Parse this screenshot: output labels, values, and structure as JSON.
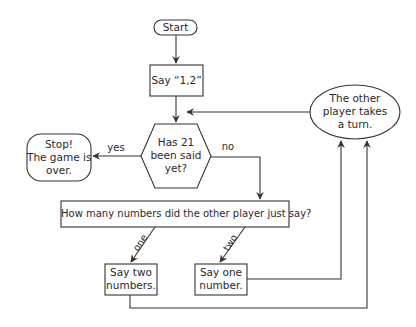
{
  "diagram": {
    "type": "flowchart",
    "nodes": {
      "start": {
        "label": "Start",
        "shape": "terminator"
      },
      "say12": {
        "label": "Say “1,2”",
        "shape": "process"
      },
      "decision": {
        "line1": "Has 21",
        "line2": "been said",
        "line3": "yet?",
        "shape": "hexagon"
      },
      "stop": {
        "line1": "Stop!",
        "line2": "The game is",
        "line3": "over.",
        "shape": "rounded-rect"
      },
      "other": {
        "line1": "The other",
        "line2": "player takes",
        "line3": "a turn.",
        "shape": "ellipse"
      },
      "question": {
        "label": "How many numbers did the other player just say?",
        "shape": "process"
      },
      "saytwo": {
        "line1": "Say two",
        "line2": "numbers.",
        "shape": "process"
      },
      "sayone": {
        "line1": "Say one",
        "line2": "number.",
        "shape": "process"
      }
    },
    "edges": {
      "yes": "yes",
      "no": "no",
      "one": "one",
      "two": "two"
    },
    "colors": {
      "stroke": "#333333",
      "text": "#2a2a2a",
      "background": "#ffffff"
    }
  }
}
